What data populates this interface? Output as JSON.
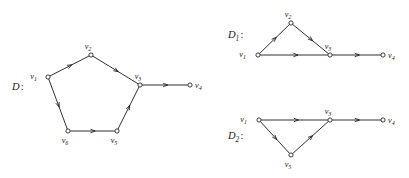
{
  "figure": {
    "ink_color": "#1a1a1a",
    "background_color": "#ffffff"
  },
  "graphs": [
    {
      "id": "D",
      "label": "D",
      "label_sub": "",
      "label_colon": ":",
      "label_pos": {
        "x": 12,
        "y": 90
      },
      "vertices": [
        {
          "name": "v1",
          "base": "v",
          "sub": "1",
          "x": 48,
          "y": 77,
          "label_dx": -11,
          "label_dy": 2
        },
        {
          "name": "v2",
          "base": "v",
          "sub": "2",
          "x": 91,
          "y": 55,
          "label_dx": -3,
          "label_dy": -6
        },
        {
          "name": "v3",
          "base": "v",
          "sub": "3",
          "x": 140,
          "y": 85,
          "label_dx": -2,
          "label_dy": -6
        },
        {
          "name": "v4",
          "base": "v",
          "sub": "4",
          "x": 190,
          "y": 85,
          "label_dx": 5,
          "label_dy": 3
        },
        {
          "name": "v5",
          "base": "v",
          "sub": "5",
          "x": 117,
          "y": 131,
          "label_dx": -3,
          "label_dy": 12
        },
        {
          "name": "v6",
          "base": "v",
          "sub": "6",
          "x": 68,
          "y": 131,
          "label_dx": -3,
          "label_dy": 12
        }
      ],
      "edges": [
        {
          "from": "v1",
          "to": "v2"
        },
        {
          "from": "v2",
          "to": "v3"
        },
        {
          "from": "v3",
          "to": "v4"
        },
        {
          "from": "v1",
          "to": "v6"
        },
        {
          "from": "v6",
          "to": "v5"
        },
        {
          "from": "v5",
          "to": "v3"
        }
      ]
    },
    {
      "id": "D1",
      "label": "D",
      "label_sub": "1",
      "label_colon": ":",
      "label_pos": {
        "x": 228,
        "y": 38
      },
      "vertices": [
        {
          "name": "v1",
          "base": "v",
          "sub": "1",
          "x": 258,
          "y": 55,
          "label_dx": -12,
          "label_dy": 2
        },
        {
          "name": "v2",
          "base": "v",
          "sub": "2",
          "x": 291,
          "y": 23,
          "label_dx": -3,
          "label_dy": -6
        },
        {
          "name": "v3",
          "base": "v",
          "sub": "3",
          "x": 330,
          "y": 55,
          "label_dx": -2,
          "label_dy": -6
        },
        {
          "name": "v4",
          "base": "v",
          "sub": "4",
          "x": 383,
          "y": 55,
          "label_dx": 5,
          "label_dy": 3
        }
      ],
      "edges": [
        {
          "from": "v1",
          "to": "v2"
        },
        {
          "from": "v2",
          "to": "v3"
        },
        {
          "from": "v1",
          "to": "v3"
        },
        {
          "from": "v3",
          "to": "v4"
        }
      ]
    },
    {
      "id": "D2",
      "label": "D",
      "label_sub": "2",
      "label_colon": ":",
      "label_pos": {
        "x": 228,
        "y": 139
      },
      "vertices": [
        {
          "name": "v1",
          "base": "v",
          "sub": "1",
          "x": 259,
          "y": 120,
          "label_dx": -12,
          "label_dy": 2
        },
        {
          "name": "v3",
          "base": "v",
          "sub": "3",
          "x": 330,
          "y": 120,
          "label_dx": -2,
          "label_dy": -6
        },
        {
          "name": "v4",
          "base": "v",
          "sub": "4",
          "x": 383,
          "y": 120,
          "label_dx": 5,
          "label_dy": 3
        },
        {
          "name": "v5",
          "base": "v",
          "sub": "5",
          "x": 291,
          "y": 155,
          "label_dx": -3,
          "label_dy": 12
        }
      ],
      "edges": [
        {
          "from": "v1",
          "to": "v3"
        },
        {
          "from": "v1",
          "to": "v5"
        },
        {
          "from": "v5",
          "to": "v3"
        },
        {
          "from": "v3",
          "to": "v4"
        }
      ]
    }
  ]
}
